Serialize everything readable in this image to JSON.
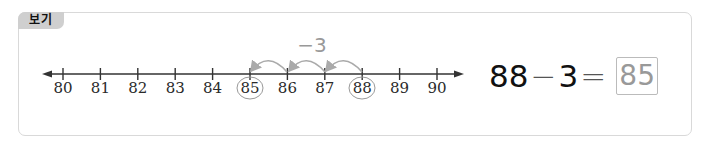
{
  "example_tag": {
    "label": "보기"
  },
  "number_line": {
    "ticks": [
      "80",
      "81",
      "82",
      "83",
      "84",
      "85",
      "86",
      "87",
      "88",
      "89",
      "90"
    ],
    "circled": [
      "85",
      "88"
    ],
    "jump_label": "−3",
    "jumps": [
      {
        "from": "88",
        "to": "87"
      },
      {
        "from": "87",
        "to": "86"
      },
      {
        "from": "86",
        "to": "85"
      }
    ],
    "colors": {
      "line": "#333333",
      "jump_arrow": "#aaaaaa",
      "circle": "#999999"
    }
  },
  "equation": {
    "minuend": "88",
    "minus": "−",
    "subtrahend": "3",
    "equals": "=",
    "answer": "85"
  }
}
